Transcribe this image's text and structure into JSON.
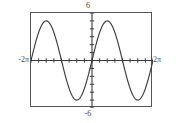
{
  "figure": {
    "kind": "graphing-calculator-plot",
    "background_color": "#ffffff",
    "frame_color": "#555555",
    "curve_color": "#3b3b3b",
    "axis_color": "#3b3b3b",
    "label_color": "#4a4a4a"
  },
  "labels": {
    "y_max": "6",
    "y_min": "-6",
    "x_min": "-2π",
    "x_max": "2π"
  },
  "chart_data": {
    "type": "line",
    "title": "",
    "subtitle": "",
    "xlabel": "",
    "ylabel": "",
    "xlim": [
      -6.283185,
      6.283185
    ],
    "ylim": [
      -6,
      6
    ],
    "xlim_labels": [
      "-2π",
      "2π"
    ],
    "ylim_labels": [
      "-6",
      "6"
    ],
    "grid": false,
    "legend": false,
    "legend_position": "none",
    "axes": {
      "x_axis_drawn": true,
      "y_axis_drawn": true,
      "x_axis_at_y": 0,
      "y_axis_at_x": 0,
      "tick_marks": true,
      "x_tick_spacing": 0.785398,
      "x_tick_spacing_label": "π/4",
      "y_tick_spacing": 1,
      "tick_labels_shown": false
    },
    "series": [
      {
        "name": "y = -5 sin(x)",
        "color": "#3b3b3b",
        "amplitude": 5,
        "period": 6.283185,
        "period_label": "2π",
        "phase": 0,
        "vertical_shift": 0,
        "x": [
          -6.283185,
          -5.89,
          -5.5,
          -5.1,
          -4.712389,
          -4.32,
          -3.93,
          -3.53,
          -3.141593,
          -2.75,
          -2.36,
          -1.96,
          -1.570796,
          -1.18,
          -0.785,
          -0.39,
          0,
          0.39,
          0.785,
          1.18,
          1.570796,
          1.96,
          2.36,
          2.75,
          3.141593,
          3.53,
          3.93,
          4.32,
          4.712389,
          5.1,
          5.5,
          5.89,
          6.283185
        ],
        "y": [
          0,
          1.91,
          3.54,
          4.62,
          5,
          4.62,
          3.54,
          1.91,
          0,
          -1.91,
          -3.54,
          -4.62,
          -5,
          -4.62,
          -3.54,
          -1.91,
          0,
          1.91,
          3.54,
          4.62,
          5,
          4.62,
          3.54,
          1.91,
          0,
          -1.91,
          -3.54,
          -4.62,
          -5,
          -4.62,
          -3.54,
          -1.91,
          0
        ],
        "key_points": {
          "maxima_x": [
            "-3π/2",
            "π/2"
          ],
          "minima_x": [
            "-π/2",
            "3π/2"
          ],
          "zeros_x": [
            "-2π",
            "-π",
            "0",
            "π",
            "2π"
          ],
          "max_value": 5,
          "min_value": -5
        }
      }
    ]
  }
}
